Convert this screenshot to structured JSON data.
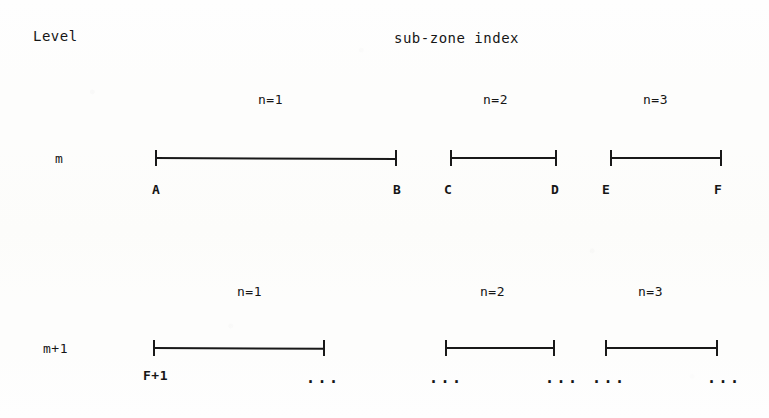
{
  "headers": {
    "level_label": "Level",
    "subzone_label": "sub-zone index"
  },
  "rows": [
    {
      "level": "m",
      "zones": [
        {
          "n_label": "n=1",
          "n_x": 258,
          "start_label": "A",
          "end_label": "B",
          "x": 155,
          "width": 242
        },
        {
          "n_label": "n=2",
          "n_x": 483,
          "start_label": "C",
          "end_label": "D",
          "x": 450,
          "width": 107
        },
        {
          "n_label": "n=3",
          "n_x": 643,
          "start_label": "E",
          "end_label": "F",
          "x": 610,
          "width": 112
        }
      ],
      "n_y": 93,
      "seg_y": 150,
      "lbl_y": 183,
      "level_x": 55,
      "level_y": 152
    },
    {
      "level": "m+1",
      "zones": [
        {
          "n_label": "n=1",
          "n_x": 237,
          "start_label": "F+1",
          "end_label": "...",
          "x": 153,
          "width": 172
        },
        {
          "n_label": "n=2",
          "n_x": 480,
          "start_label": "...",
          "end_label": "...",
          "x": 445,
          "width": 110
        },
        {
          "n_label": "n=3",
          "n_x": 638,
          "start_label": "...",
          "end_label": "...",
          "x": 605,
          "width": 113
        }
      ],
      "n_y": 285,
      "seg_y": 340,
      "lbl_y": 369,
      "level_x": 43,
      "level_y": 342
    }
  ],
  "colors": {
    "ink": "#191919",
    "paper": "#fdfdfc"
  }
}
